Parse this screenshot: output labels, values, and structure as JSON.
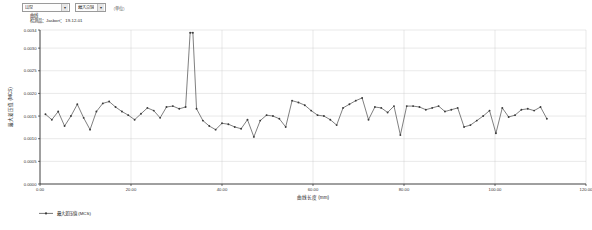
{
  "toolbar": {
    "dataset_select": {
      "value": "山型",
      "caret": "chevron-down-icon"
    },
    "mode_select": {
      "value": "最大点值",
      "caret": "chevron-down-icon"
    },
    "note": "（单位）"
  },
  "meta": {
    "line1": "曲线",
    "line2": "检测品：Jasbort： 19-12-01"
  },
  "chart_data": {
    "type": "line",
    "title": "",
    "xlabel": "曲线长度 (mm)",
    "ylabel": "最大差压值 (MCS)",
    "xlim": [
      0,
      120
    ],
    "ylim": [
      0,
      0.0034
    ],
    "grid": true,
    "legend_position": "bottom",
    "legend": [
      "最大差压值 (MCS)"
    ],
    "series_color": "#3b3b3b",
    "xticks": [
      "0.00",
      "20.00",
      "40.00",
      "60.00",
      "80.00",
      "100.00",
      "120.00"
    ],
    "xtick_values": [
      0,
      20,
      40,
      60,
      80,
      100,
      120
    ],
    "yticks": [
      "0.0000",
      "0.0005",
      "0.0010",
      "0.0015",
      "0.0020",
      "0.0025",
      "0.0030",
      "0.0034"
    ],
    "ytick_values": [
      0.0,
      0.0005,
      0.001,
      0.0015,
      0.002,
      0.0025,
      0.003,
      0.0034
    ],
    "series": [
      {
        "name": "最大差压值 (MCS)",
        "x": [
          1.2,
          2.6,
          4.0,
          5.4,
          6.8,
          8.2,
          9.6,
          11.0,
          12.4,
          13.8,
          15.2,
          16.6,
          18.0,
          19.4,
          20.8,
          22.2,
          23.6,
          25.0,
          26.4,
          27.8,
          29.2,
          30.6,
          32.0,
          33.0,
          33.6,
          34.4,
          35.8,
          37.2,
          38.6,
          40.0,
          41.4,
          42.8,
          44.2,
          45.6,
          47.0,
          48.4,
          49.8,
          51.2,
          52.6,
          54.0,
          55.4,
          56.8,
          58.2,
          59.6,
          61.0,
          62.4,
          63.8,
          65.2,
          66.6,
          68.0,
          69.4,
          70.8,
          72.2,
          73.6,
          75.0,
          76.4,
          77.8,
          79.2,
          80.6,
          82.0,
          83.4,
          84.8,
          86.2,
          87.6,
          89.0,
          90.4,
          91.8,
          93.2,
          94.6,
          96.0,
          97.4,
          98.8,
          100.2,
          101.6,
          103.0,
          104.4,
          105.8,
          107.2,
          108.6,
          110.0,
          111.4
        ],
        "y": [
          0.00154,
          0.00142,
          0.0016,
          0.00128,
          0.0015,
          0.00176,
          0.00146,
          0.0012,
          0.0016,
          0.00178,
          0.00182,
          0.0017,
          0.0016,
          0.00152,
          0.00142,
          0.00155,
          0.00168,
          0.00162,
          0.00146,
          0.0017,
          0.00172,
          0.00166,
          0.0017,
          0.00334,
          0.00334,
          0.00166,
          0.0014,
          0.00128,
          0.0012,
          0.00134,
          0.00132,
          0.00126,
          0.00122,
          0.00142,
          0.00104,
          0.0014,
          0.00152,
          0.0015,
          0.00144,
          0.00126,
          0.00184,
          0.0018,
          0.00174,
          0.00162,
          0.00152,
          0.0015,
          0.00142,
          0.0013,
          0.00168,
          0.00176,
          0.00184,
          0.0019,
          0.00142,
          0.0017,
          0.00168,
          0.00158,
          0.00172,
          0.00108,
          0.00172,
          0.00172,
          0.0017,
          0.00164,
          0.00168,
          0.00172,
          0.0016,
          0.00164,
          0.00168,
          0.00126,
          0.0013,
          0.0014,
          0.0015,
          0.00162,
          0.00112,
          0.00168,
          0.00148,
          0.00152,
          0.00164,
          0.00166,
          0.00162,
          0.0017,
          0.00144
        ]
      }
    ]
  }
}
